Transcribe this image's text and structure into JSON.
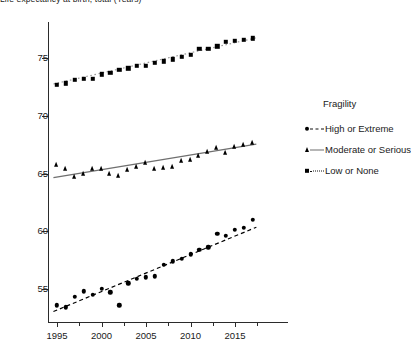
{
  "chart_data": {
    "type": "scatter",
    "title": "",
    "ylabel": "Life expectancy at birth, total (Years)",
    "ylabel_clipped": "rth, total (Years)",
    "xlabel": "",
    "xlim": [
      1994,
      2018
    ],
    "ylim": [
      52.5,
      78
    ],
    "yticks": [
      55,
      60,
      65,
      70,
      75
    ],
    "xticks": [
      1995,
      2000,
      2005,
      2010,
      2015
    ],
    "xticks_minor": [
      1997.5,
      2002.5,
      2007.5,
      2012.5,
      2017.5
    ],
    "grid": false,
    "legend_position": "right",
    "legend_title": "Fragility",
    "series": [
      {
        "name": "High or Extreme",
        "marker": "circle",
        "line": "dashed",
        "color": "#000000",
        "trend": {
          "x": [
            1994.6,
            2017.4
          ],
          "y": [
            53.05,
            60.35
          ]
        },
        "x": [
          1995,
          1996,
          1997,
          1998,
          1999,
          2000,
          2001,
          2002,
          2003,
          2004,
          2005,
          2006,
          2007,
          2008,
          2009,
          2010,
          2011,
          2012,
          2013,
          2014,
          2015,
          2016,
          2017
        ],
        "y": [
          53.6,
          53.4,
          54.3,
          54.8,
          54.5,
          55.0,
          54.7,
          53.6,
          55.5,
          55.9,
          56.0,
          56.1,
          57.1,
          57.4,
          57.6,
          58.0,
          58.4,
          58.6,
          59.8,
          59.6,
          60.1,
          60.3,
          61.0
        ]
      },
      {
        "name": "Moderate or Serious",
        "marker": "triangle",
        "line": "solid",
        "color": "#6f6f6f",
        "trend": {
          "x": [
            1994.6,
            2017.4
          ],
          "y": [
            64.65,
            67.55
          ]
        },
        "x": [
          1995,
          1996,
          1997,
          1998,
          1999,
          2000,
          2001,
          2002,
          2003,
          2004,
          2005,
          2006,
          2007,
          2008,
          2009,
          2010,
          2011,
          2012,
          2013,
          2014,
          2015,
          2016,
          2017
        ],
        "y": [
          65.7,
          65.4,
          64.7,
          65.0,
          65.4,
          65.4,
          65.0,
          64.8,
          65.3,
          65.6,
          65.9,
          65.4,
          65.5,
          65.6,
          66.1,
          66.2,
          66.5,
          66.9,
          67.2,
          66.8,
          67.3,
          67.5,
          67.6
        ]
      },
      {
        "name": "Low or None",
        "marker": "square",
        "line": "dotted",
        "color": "#9a9a9a",
        "trend": {
          "x": [
            1994.6,
            2017.4
          ],
          "y": [
            72.75,
            76.75
          ]
        },
        "x": [
          1995,
          1996,
          1997,
          1998,
          1999,
          2000,
          2001,
          2002,
          2003,
          2004,
          2005,
          2006,
          2007,
          2008,
          2009,
          2010,
          2011,
          2012,
          2013,
          2014,
          2015,
          2016,
          2017
        ],
        "y": [
          72.7,
          72.8,
          73.1,
          73.2,
          73.2,
          73.6,
          73.7,
          74.0,
          74.1,
          74.3,
          74.3,
          74.6,
          74.7,
          74.9,
          75.1,
          75.3,
          75.8,
          75.8,
          76.0,
          76.4,
          76.5,
          76.6,
          76.7
        ]
      }
    ]
  },
  "legend": {
    "title": "Fragility",
    "items": [
      {
        "label": "High or Extreme"
      },
      {
        "label": "Moderate or Serious"
      },
      {
        "label": "Low or None"
      }
    ]
  }
}
